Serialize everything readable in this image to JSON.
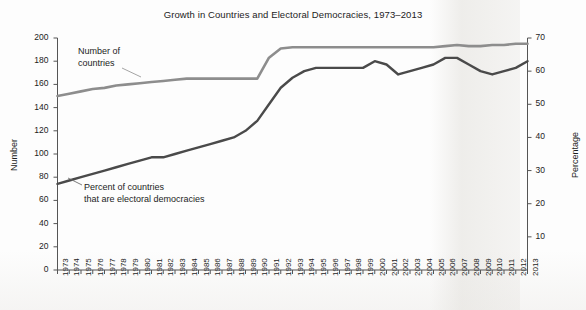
{
  "chart_data": {
    "type": "line",
    "title": "Growth in Countries and Electoral Democracies, 1973–2013",
    "xlabel": "",
    "ylabel": "Number",
    "ylabel_secondary": "Percentage",
    "ylim": [
      0,
      200
    ],
    "ylim_secondary": [
      0,
      70
    ],
    "ytick_step": 20,
    "ytick_step_secondary": 10,
    "grid": false,
    "legend_position": "inline-annotations",
    "x": [
      1973,
      1974,
      1975,
      1976,
      1977,
      1978,
      1979,
      1980,
      1981,
      1982,
      1983,
      1984,
      1985,
      1986,
      1987,
      1988,
      1989,
      1990,
      1991,
      1992,
      1993,
      1994,
      1995,
      1996,
      1997,
      1998,
      1999,
      2000,
      2001,
      2002,
      2003,
      2004,
      2005,
      2006,
      2007,
      2008,
      2009,
      2010,
      2011,
      2012,
      2013
    ],
    "categories": [
      "1973",
      "1974",
      "1975",
      "1976",
      "1977",
      "1978",
      "1979",
      "1980",
      "1981",
      "1982",
      "1983",
      "1984",
      "1985",
      "1986",
      "1987",
      "1988",
      "1989",
      "1990",
      "1991",
      "1992",
      "1993",
      "1994",
      "1995",
      "1996",
      "1997",
      "1998",
      "1999",
      "2000",
      "2001",
      "2002",
      "2003",
      "2004",
      "2005",
      "2006",
      "2007",
      "2008",
      "2009",
      "2010",
      "2011",
      "2012",
      "2013"
    ],
    "ytick_labels": [
      "0",
      "20",
      "40",
      "60",
      "80",
      "100",
      "120",
      "140",
      "160",
      "180",
      "200"
    ],
    "ytick_labels_secondary": [
      "10",
      "20",
      "30",
      "40",
      "50",
      "60",
      "70"
    ],
    "series": [
      {
        "name": "Number of countries",
        "axis": "left",
        "color": "#8d8d8d",
        "annotation": "Number of\ncountries",
        "values": [
          150,
          152,
          154,
          156,
          157,
          159,
          160,
          161,
          162,
          163,
          164,
          165,
          165,
          165,
          165,
          165,
          165,
          165,
          183,
          191,
          192,
          192,
          192,
          192,
          192,
          192,
          192,
          192,
          192,
          192,
          192,
          192,
          192,
          193,
          194,
          193,
          193,
          194,
          194,
          195,
          195
        ]
      },
      {
        "name": "Percent of countries that are electoral democracies",
        "axis": "right",
        "color": "#4a4a4a",
        "annotation": "Percent of countries\nthat are electoral democracies",
        "values": [
          26,
          27,
          28,
          29,
          30,
          31,
          32,
          33,
          34,
          34,
          35,
          36,
          37,
          38,
          39,
          40,
          42,
          45,
          50,
          55,
          58,
          60,
          61,
          61,
          61,
          61,
          61,
          63,
          62,
          59,
          60,
          61,
          62,
          64,
          64,
          62,
          60,
          59,
          60,
          61,
          63
        ]
      }
    ]
  }
}
